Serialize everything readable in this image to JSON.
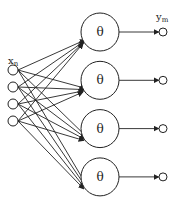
{
  "diagram": {
    "type": "neural-network",
    "input_layer": {
      "label": "x",
      "label_subscript": "n",
      "node_count": 4
    },
    "hidden_layer": {
      "node_symbol": "θ",
      "node_count": 4
    },
    "output_layer": {
      "label": "y",
      "label_subscript": "m",
      "node_count": 4
    },
    "connections": {
      "input_to_hidden": "fully-connected",
      "hidden_to_output": "one-to-one",
      "directed": true
    },
    "colors": {
      "stroke": "#222222",
      "background": "#ffffff"
    }
  }
}
